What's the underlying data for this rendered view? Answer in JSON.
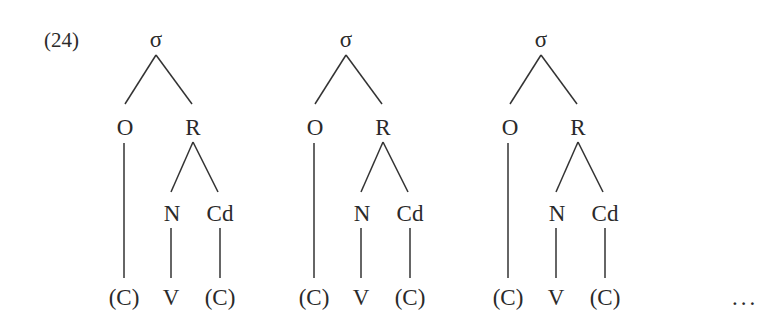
{
  "example_number": "(24)",
  "ellipsis": "...",
  "trees": [
    {
      "offset_x": 0,
      "nodes": {
        "root": "σ",
        "onset": "O",
        "rhyme": "R",
        "nucleus": "N",
        "coda": "Cd",
        "onset_segment": "(C)",
        "nucleus_segment": "V",
        "coda_segment": "(C)"
      }
    },
    {
      "offset_x": 190,
      "nodes": {
        "root": "σ",
        "onset": "O",
        "rhyme": "R",
        "nucleus": "N",
        "coda": "Cd",
        "onset_segment": "(C)",
        "nucleus_segment": "V",
        "coda_segment": "(C)"
      }
    },
    {
      "offset_x": 385,
      "nodes": {
        "root": "σ",
        "onset": "O",
        "rhyme": "R",
        "nucleus": "N",
        "coda": "Cd",
        "onset_segment": "(C)",
        "nucleus_segment": "V",
        "coda_segment": "(C)"
      }
    }
  ],
  "colors": {
    "ink": "#2a2a2a",
    "background": "#ffffff"
  }
}
